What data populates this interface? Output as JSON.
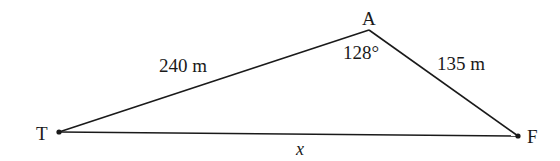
{
  "diagram": {
    "type": "triangle",
    "vertices": {
      "T": {
        "label": "T"
      },
      "A": {
        "label": "A"
      },
      "F": {
        "label": "F"
      }
    },
    "sides": {
      "TA": {
        "label": "240 m"
      },
      "AF": {
        "label": "135 m"
      },
      "TF": {
        "label": "x"
      }
    },
    "angles": {
      "A": {
        "label": "128°"
      }
    }
  }
}
